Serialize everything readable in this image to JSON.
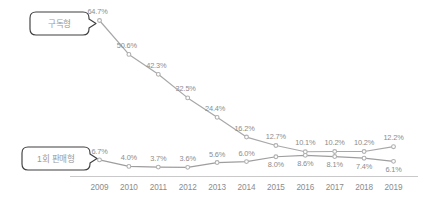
{
  "chart_data": {
    "type": "line",
    "title": "",
    "xlabel": "",
    "ylabel": "",
    "grid": false,
    "legend_position": "inline-callout",
    "categories": [
      "2009",
      "2010",
      "2011",
      "2012",
      "2013",
      "2014",
      "2015",
      "2016",
      "2017",
      "2018",
      "2019"
    ],
    "ylim": [
      0,
      70
    ],
    "series": [
      {
        "name": "구독형",
        "color": "#a8a8a8",
        "values": [
          64.7,
          50.6,
          42.3,
          32.5,
          24.4,
          16.2,
          12.7,
          10.1,
          10.2,
          10.2,
          12.2
        ],
        "labels": [
          "64.7%",
          "50.6%",
          "42.3%",
          "32.5%",
          "24.4%",
          "16.2%",
          "12.7%",
          "10.1%",
          "10.2%",
          "10.2%",
          "12.2%"
        ]
      },
      {
        "name": "1회 판매형",
        "color": "#9e9e9e",
        "values": [
          6.7,
          4.0,
          3.7,
          3.6,
          5.6,
          6.0,
          8.0,
          8.6,
          8.1,
          7.4,
          6.1
        ],
        "labels": [
          "6.7%",
          "4.0%",
          "3.7%",
          "3.6%",
          "5.6%",
          "6.0%",
          "8.0%",
          "8.6%",
          "8.1%",
          "7.4%",
          "6.1%"
        ]
      }
    ]
  },
  "callouts": [
    {
      "id": "subscription",
      "label": "구독형"
    },
    {
      "id": "onetime",
      "label": "1회 판매형"
    }
  ],
  "axis": {
    "tick_labels": [
      "2009",
      "2010",
      "2011",
      "2012",
      "2013",
      "2014",
      "2015",
      "2016",
      "2017",
      "2018",
      "2019"
    ]
  },
  "colors": {
    "line_primary": "#a8a8a8",
    "line_secondary": "#9e9e9e",
    "marker": "#b0b0b0",
    "text": "#8c8c8c",
    "axis": "#c9c9c9",
    "bubble_border": "#4a4a4a",
    "background": "#ffffff"
  }
}
